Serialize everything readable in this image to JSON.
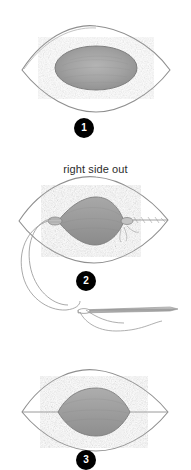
{
  "document": {
    "type": "sewing-instruction-diagram",
    "background_color": "#ffffff",
    "ink_color": "#8a8a8a",
    "shade_color": "#9e9e9e",
    "badge_color": "#000000",
    "badge_text_color": "#ffffff",
    "text_color": "#2b2b2b"
  },
  "steps": [
    {
      "id": "step-1",
      "number": "1",
      "caption": "",
      "figure_name": "lens-shape-with-shaded-oval"
    },
    {
      "id": "step-2",
      "number": "2",
      "caption": "right side out",
      "figure_name": "gathered-lens-with-needle-and-thread"
    },
    {
      "id": "step-3",
      "number": "3",
      "caption": "",
      "figure_name": "lens-shape-with-center-seam-and-shaded-center"
    }
  ],
  "icons": {
    "needle": "sewing-needle-icon",
    "thread": "thread-curve-icon",
    "stitch": "running-stitch-icon"
  }
}
